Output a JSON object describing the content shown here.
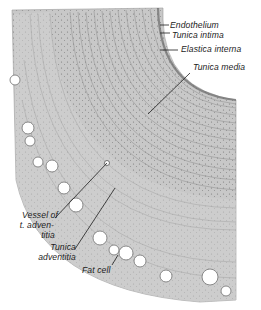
{
  "figure": {
    "colors": {
      "background": "#ffffff",
      "tissue_light": "#d4d4d4",
      "tissue_mid": "#b8b8b8",
      "tissue_dark": "#8e8e8e",
      "nuclei": "#555555",
      "leader_line": "#1c1c1c"
    },
    "labels": {
      "endothelium": "Endothelium",
      "tunica_intima": "Tunica intima",
      "elastica_interna": "Elastica interna",
      "tunica_media": "Tunica media",
      "vessel_line1": "Vessel of",
      "vessel_line2": "t. adven-",
      "vessel_line3": "titia",
      "tunica_adventitia_line1": "Tunica",
      "tunica_adventitia_line2": "adventitia",
      "fat_cell": "Fat cell"
    }
  }
}
